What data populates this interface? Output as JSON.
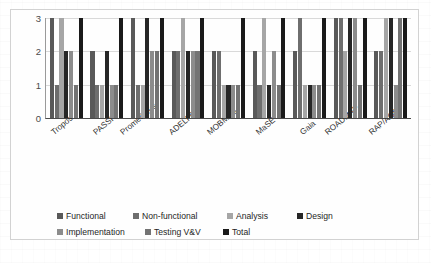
{
  "chart_data": {
    "type": "bar",
    "title": "",
    "subtitle": "",
    "xlabel": "",
    "ylabel": "",
    "ylim": [
      0,
      3
    ],
    "yticks": [
      "0",
      "1",
      "2",
      "3"
    ],
    "grid": true,
    "legend_position": "bottom",
    "categories": [
      "Tropos",
      "PASSI",
      "Prometheus",
      "ADELFE",
      "MOBMAS",
      "MaSE",
      "Gaia",
      "ROADMAP",
      "RAP/AOR"
    ],
    "series": [
      {
        "name": "Functional",
        "color": "#595959",
        "values": [
          3,
          2,
          3,
          2,
          2,
          2,
          2,
          3,
          2
        ]
      },
      {
        "name": "Non-functional",
        "color": "#6e6e6e",
        "values": [
          1,
          1,
          1,
          2,
          2,
          1,
          3,
          3,
          2
        ]
      },
      {
        "name": "Analysis",
        "color": "#a6a6a6",
        "values": [
          3,
          1,
          1,
          3,
          1,
          3,
          1,
          2,
          3
        ]
      },
      {
        "name": "Design",
        "color": "#262626",
        "values": [
          2,
          2,
          3,
          2,
          1,
          1,
          1,
          3,
          3
        ]
      },
      {
        "name": "Implementation",
        "color": "#8c8c8c",
        "values": [
          2,
          1,
          2,
          2,
          1,
          2,
          1,
          3,
          1
        ]
      },
      {
        "name": "Testing V&V",
        "color": "#737373",
        "values": [
          1,
          1,
          2,
          2,
          1,
          1,
          1,
          1,
          3
        ]
      },
      {
        "name": "Total",
        "color": "#1a1a1a",
        "values": [
          3,
          3,
          3,
          3,
          3,
          3,
          3,
          3,
          3
        ]
      }
    ]
  },
  "legend": {
    "row1": [
      {
        "label": "Functional"
      },
      {
        "label": "Non-functional"
      },
      {
        "label": "Analysis"
      },
      {
        "label": "Design"
      }
    ],
    "row2": [
      {
        "label": "Implementation"
      },
      {
        "label": "Testing V&V"
      },
      {
        "label": "Total"
      }
    ]
  }
}
